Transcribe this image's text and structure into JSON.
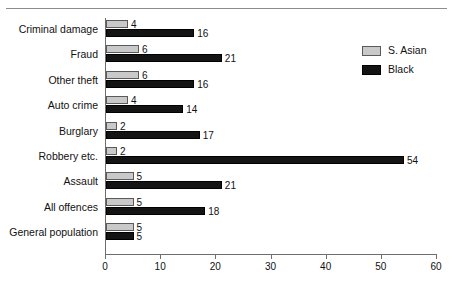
{
  "chart_data": {
    "type": "bar",
    "orientation": "horizontal",
    "title": "",
    "xlabel": "",
    "ylabel": "",
    "xlim": [
      0,
      60
    ],
    "xticks": [
      0,
      10,
      20,
      30,
      40,
      50,
      60
    ],
    "grid": false,
    "legend_position": "top-right",
    "categories": [
      "Criminal damage",
      "Fraud",
      "Other theft",
      "Auto crime",
      "Burglary",
      "Robbery etc.",
      "Assault",
      "All offences",
      "General population"
    ],
    "series": [
      {
        "name": "S. Asian",
        "color": "#c9c9c9",
        "values": [
          4,
          6,
          6,
          4,
          2,
          2,
          5,
          5,
          5
        ]
      },
      {
        "name": "Black",
        "color": "#141414",
        "values": [
          16,
          21,
          16,
          14,
          17,
          54,
          21,
          18,
          5
        ]
      }
    ]
  },
  "legend": {
    "items": [
      {
        "label": "S. Asian",
        "swatch": "asian"
      },
      {
        "label": "Black",
        "swatch": "black"
      }
    ]
  },
  "axis": {
    "tick_labels": [
      "0",
      "10",
      "20",
      "30",
      "40",
      "50",
      "60"
    ]
  }
}
